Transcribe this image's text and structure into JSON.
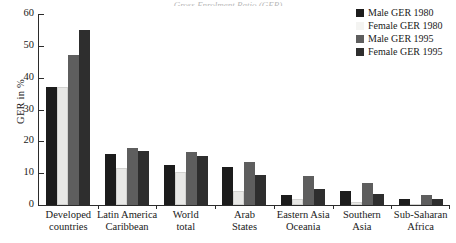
{
  "title_sliver": "Gross Enrolment Ratio (GER)",
  "chart_data": {
    "type": "bar",
    "title": "",
    "xlabel": "",
    "ylabel": "GER in %",
    "ylim": [
      0,
      60
    ],
    "yticks": [
      0,
      10,
      20,
      30,
      40,
      50,
      60
    ],
    "grid": false,
    "legend_position": "top-right",
    "categories": [
      "Developed countries",
      "Latin America Caribbean",
      "World total",
      "Arab States",
      "Eastern Asia Oceania",
      "Southern Asia",
      "Sub-Saharan Africa"
    ],
    "category_lines": [
      [
        "Developed",
        "countries"
      ],
      [
        "Latin America",
        "Caribbean"
      ],
      [
        "World",
        "total"
      ],
      [
        "Arab",
        "States"
      ],
      [
        "Eastern Asia",
        "Oceania"
      ],
      [
        "Southern",
        "Asia"
      ],
      [
        "Sub-Saharan",
        "Africa"
      ]
    ],
    "series": [
      {
        "name": "Male GER 1980",
        "color": "#1c1c1c",
        "values": [
          37,
          16,
          12.5,
          12,
          3,
          4.5,
          2
        ]
      },
      {
        "name": "Female GER 1980",
        "color": "#f4f4f2",
        "values": [
          37,
          11.5,
          10.5,
          4.5,
          2,
          0.8,
          0.3
        ]
      },
      {
        "name": "Male GER 1995",
        "color": "#5e5e5e",
        "values": [
          47,
          18,
          16.5,
          13.5,
          9,
          7,
          3
        ]
      },
      {
        "name": "Female GER 1995",
        "color": "#2e2e2e",
        "values": [
          55,
          17,
          15.5,
          9.5,
          5,
          3.5,
          1.8
        ]
      }
    ]
  },
  "legend": {
    "items": [
      {
        "label": "Male GER 1980"
      },
      {
        "label": "Female GER 1980"
      },
      {
        "label": "Male GER 1995"
      },
      {
        "label": "Female GER 1995"
      }
    ]
  }
}
